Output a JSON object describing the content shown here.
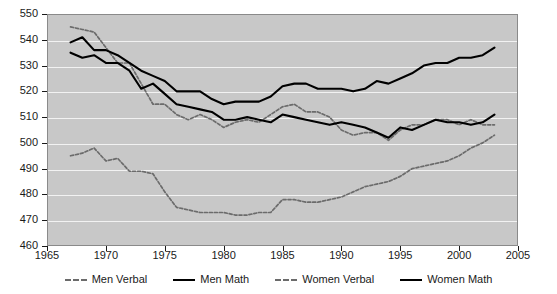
{
  "chart_data": {
    "type": "line",
    "title": "",
    "xlabel": "",
    "ylabel": "",
    "xlim": [
      1965,
      2005
    ],
    "ylim": [
      460,
      550
    ],
    "grid": true,
    "legend_position": "bottom",
    "xticks": [
      1965,
      1970,
      1975,
      1980,
      1985,
      1990,
      1995,
      2000,
      2005
    ],
    "yticks": [
      460,
      470,
      480,
      490,
      500,
      510,
      520,
      530,
      540,
      550
    ],
    "x": [
      1967,
      1968,
      1969,
      1970,
      1971,
      1972,
      1973,
      1974,
      1975,
      1976,
      1977,
      1978,
      1979,
      1980,
      1981,
      1982,
      1983,
      1984,
      1985,
      1986,
      1987,
      1988,
      1989,
      1990,
      1991,
      1992,
      1993,
      1994,
      1995,
      1996,
      1997,
      1998,
      1999,
      2000,
      2001,
      2002,
      2003
    ],
    "series": [
      {
        "name": "Men Verbal",
        "style": "dashed",
        "color": "#6b6b6b",
        "values": [
          545,
          544,
          543,
          537,
          531,
          531,
          523,
          515,
          515,
          511,
          509,
          511,
          509,
          506,
          508,
          509,
          508,
          511,
          514,
          515,
          512,
          512,
          510,
          505,
          503,
          504,
          504,
          501,
          505,
          507,
          507,
          509,
          509,
          507,
          509,
          507,
          507
        ]
      },
      {
        "name": "Men Math",
        "style": "solid",
        "color": "#000000",
        "values": [
          539,
          541,
          536,
          536,
          534,
          531,
          528,
          526,
          524,
          520,
          520,
          520,
          517,
          515,
          516,
          516,
          516,
          518,
          522,
          523,
          523,
          521,
          521,
          521,
          520,
          521,
          524,
          523,
          525,
          527,
          530,
          531,
          531,
          533,
          533,
          534,
          537
        ]
      },
      {
        "name": "Women Verbal",
        "style": "dashed",
        "color": "#6b6b6b",
        "values": [
          495,
          496,
          498,
          493,
          494,
          489,
          489,
          488,
          481,
          475,
          474,
          473,
          473,
          473,
          472,
          472,
          473,
          473,
          478,
          478,
          477,
          477,
          478,
          479,
          481,
          483,
          484,
          485,
          487,
          490,
          491,
          492,
          493,
          495,
          498,
          500,
          503
        ]
      },
      {
        "name": "Women Math",
        "style": "solid",
        "color": "#000000",
        "values": [
          535,
          533,
          534,
          531,
          531,
          528,
          521,
          523,
          519,
          515,
          514,
          513,
          512,
          509,
          509,
          510,
          509,
          508,
          511,
          510,
          509,
          508,
          507,
          508,
          507,
          506,
          504,
          502,
          506,
          505,
          507,
          509,
          508,
          508,
          507,
          508,
          511
        ]
      }
    ]
  },
  "legend": {
    "items": [
      {
        "label": "Men Verbal",
        "style": "dashed"
      },
      {
        "label": "Men Math",
        "style": "solid"
      },
      {
        "label": "Women Verbal",
        "style": "dashed"
      },
      {
        "label": "Women Math",
        "style": "solid"
      }
    ]
  }
}
